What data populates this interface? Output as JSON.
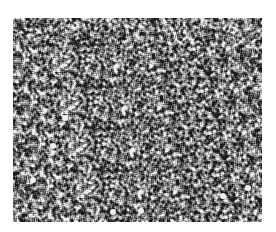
{
  "image": {
    "description": "Grayscale micrograph-like noise texture",
    "colors": {
      "background": "#ffffff",
      "mid_gray": "#6a6a6a",
      "dark": "#1e1e1e",
      "light": "#e6e6e6"
    },
    "region": {
      "x": 13,
      "y": 18,
      "width": 249,
      "height": 204
    }
  }
}
